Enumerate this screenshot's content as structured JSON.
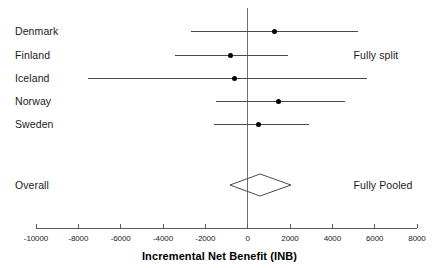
{
  "chart_data": {
    "type": "forest",
    "title": "",
    "xlabel": "Incremental Net Benefit (INB)",
    "ylabel": "",
    "xlim": [
      -10000,
      8000
    ],
    "xticks": [
      -10000,
      -8000,
      -6000,
      -4000,
      -2000,
      0,
      2000,
      4000,
      6000,
      8000
    ],
    "xticklabels": [
      "-10000",
      "-8000",
      "-6000",
      "-4000",
      "-2000",
      "0",
      "2000",
      "4000",
      "6000",
      "8000"
    ],
    "grid": false,
    "reference_line": 0,
    "legend_position": "none",
    "annotations": [
      {
        "text": "Fully split",
        "x": 5000,
        "row": "Finland"
      },
      {
        "text": "Fully Pooled",
        "x": 5000,
        "row": "Overall"
      }
    ],
    "studies": [
      {
        "label": "Denmark",
        "estimate": 1270,
        "ci_low": -2700,
        "ci_high": 5200
      },
      {
        "label": "Finland",
        "estimate": -800,
        "ci_low": -3450,
        "ci_high": 1890
      },
      {
        "label": "Iceland",
        "estimate": -610,
        "ci_low": -7550,
        "ci_high": 5660
      },
      {
        "label": "Norway",
        "estimate": 1460,
        "ci_low": -1510,
        "ci_high": 4580
      },
      {
        "label": "Sweden",
        "estimate": 520,
        "ci_low": -1600,
        "ci_high": 2880
      }
    ],
    "overall": {
      "label": "Overall",
      "estimate": 570,
      "ci_low": -850,
      "ci_high": 2030,
      "marker": "diamond"
    }
  },
  "figure": {
    "axis_title": "Incremental Net Benefit (INB)",
    "annotation_split": "Fully split",
    "annotation_pooled": "Fully Pooled",
    "overall_label": "Overall",
    "study_labels": {
      "denmark": "Denmark",
      "finland": "Finland",
      "iceland": "Iceland",
      "norway": "Norway",
      "sweden": "Sweden"
    },
    "tick_labels": {
      "t0": "-10000",
      "t1": "-8000",
      "t2": "-6000",
      "t3": "-4000",
      "t4": "-2000",
      "t5": "0",
      "t6": "2000",
      "t7": "4000",
      "t8": "6000",
      "t9": "8000"
    },
    "colors": {
      "marker": "#000000",
      "line": "#4a4a4a",
      "axis": "#5a5a5a",
      "reference": "#6e6e6e",
      "text": "#1a1a1a",
      "background": "#ffffff"
    }
  }
}
